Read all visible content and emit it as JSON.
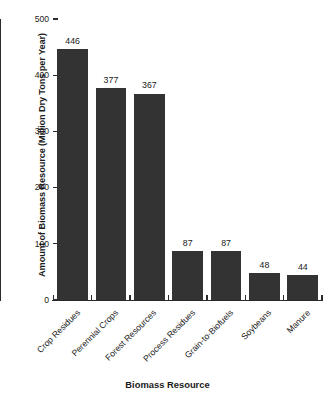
{
  "chart_data": {
    "type": "bar",
    "title": "",
    "xlabel": "Biomass Resource",
    "ylabel": "Amount of Biomass Resource (Million Dry Tons per Year)",
    "categories": [
      "Crop Residues",
      "Perennial Crops",
      "Forest Resources",
      "Process Residues",
      "Grain-to-Biofuels",
      "Soybeans",
      "Manure"
    ],
    "values": [
      446,
      377,
      367,
      87,
      87,
      48,
      44
    ],
    "value_labels": [
      "446",
      "377",
      "367",
      "87",
      "87",
      "48",
      "44"
    ],
    "ylim": [
      0,
      500
    ],
    "yticks": [
      0,
      100,
      200,
      300,
      400,
      500
    ],
    "ytick_labels": [
      "0",
      "100",
      "200",
      "300",
      "400",
      "500"
    ],
    "grid": false,
    "legend": false,
    "legend_position": "none",
    "bar_color": "#333333",
    "axis_color": "#2b2b2b",
    "background_color": "#ffffff"
  }
}
